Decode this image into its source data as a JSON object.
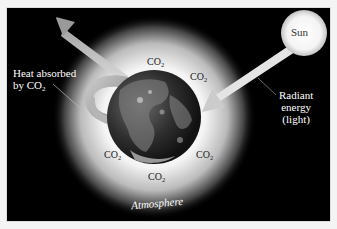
{
  "diagram": {
    "type": "greenhouse-effect",
    "background_color": "#000000",
    "labels": {
      "heat_absorbed_line1": "Heat absorbed",
      "heat_absorbed_line2_prefix": "by CO",
      "heat_absorbed_line2_sub": "2",
      "radiant_line1": "Radiant",
      "radiant_line2": "energy",
      "radiant_line3": "(light)",
      "sun": "Sun",
      "atmosphere": "Atmosphere"
    },
    "co2_markers": [
      {
        "prefix": "CO",
        "sub": "2",
        "position": "top"
      },
      {
        "prefix": "CO",
        "sub": "2",
        "position": "top-right"
      },
      {
        "prefix": "CO",
        "sub": "2",
        "position": "bottom-left"
      },
      {
        "prefix": "CO",
        "sub": "2",
        "position": "bottom-right"
      },
      {
        "prefix": "CO",
        "sub": "2",
        "position": "bottom"
      }
    ],
    "elements": [
      "earth",
      "atmosphere-glow",
      "sun",
      "incoming-arrow",
      "outgoing-arrow",
      "curled-heat-arrow"
    ]
  }
}
